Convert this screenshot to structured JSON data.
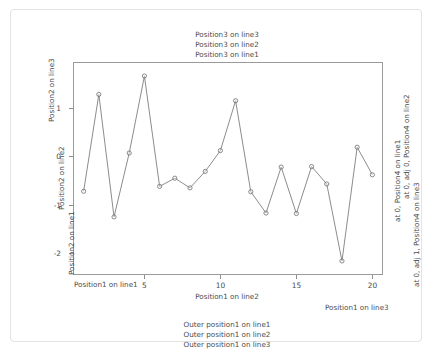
{
  "figure": {
    "background_color": "#ffffff",
    "frame_border_color": "#e3e3e5",
    "plot_border_color": "#9a9a9a",
    "line_color": "#6e6e6e",
    "point_color": "#6e6e6e"
  },
  "top_titles": [
    "Position3 on line3",
    "Position3 on line2",
    "Position3 on line1"
  ],
  "left_labels": [
    "Position2 on line3",
    "Position2 on line2",
    "Position2 on line1"
  ],
  "right_labels": [
    "at 0, Position4 on line1",
    "at 0, adj 0, Position4 on line2",
    "at 0, adj 1, Position4 on line3"
  ],
  "bottom_labels": [
    "Position1 on line1",
    "Position1 on line2",
    "Position1 on line3"
  ],
  "bottom_outer_labels": [
    "Outer position1 on line1",
    "Outer position1 on line2",
    "Outer position1 on line3"
  ],
  "chart_data": {
    "type": "line",
    "title": "",
    "subtitle": "",
    "xlabel": "Position1 on line2",
    "ylabel": "Position2 on line2",
    "grid": false,
    "legend": "none",
    "marker": "open-circle",
    "x": [
      1,
      2,
      3,
      4,
      5,
      6,
      7,
      8,
      9,
      10,
      11,
      12,
      13,
      14,
      15,
      16,
      17,
      18,
      19,
      20
    ],
    "y": [
      -0.72,
      1.28,
      -1.25,
      0.07,
      1.66,
      -0.62,
      -0.45,
      -0.65,
      -0.31,
      0.12,
      1.15,
      -0.73,
      -1.17,
      -0.22,
      -1.18,
      -0.21,
      -0.57,
      -2.16,
      0.19,
      -0.38
    ],
    "xlim": [
      0.3,
      20.7
    ],
    "ylim": [
      -2.45,
      1.95
    ],
    "xticks": [
      5,
      10,
      15,
      20
    ],
    "xticklabels": [
      "5",
      "10",
      "15",
      "20"
    ],
    "yticks": [
      1,
      0,
      -1,
      -2
    ],
    "yticklabels": [
      "1",
      "0",
      "-1",
      "-2"
    ]
  }
}
